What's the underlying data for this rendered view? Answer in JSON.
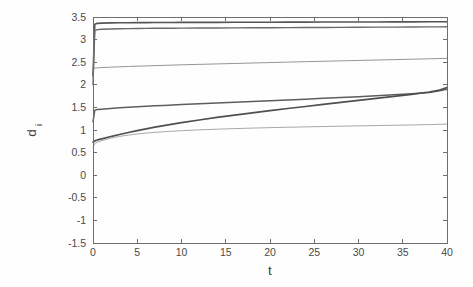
{
  "figure": {
    "background_color": "#fefefe",
    "axes_color": "#6e6e6e",
    "tick_label_color": "#4a4a4a"
  },
  "chart_data": {
    "type": "line",
    "title": "",
    "subtitle": "",
    "xlabel": "t",
    "ylabel": "d_i",
    "ylabel_base": "d",
    "ylabel_subscript": "i",
    "xlim": [
      0,
      40
    ],
    "ylim": [
      -1.5,
      3.5
    ],
    "xticks": [
      0,
      5,
      10,
      15,
      20,
      25,
      30,
      35,
      40
    ],
    "xtick_labels": [
      "0",
      "5",
      "10",
      "15",
      "20",
      "25",
      "30",
      "35",
      "40"
    ],
    "yticks": [
      -1.5,
      -1,
      -0.5,
      0,
      0.5,
      1,
      1.5,
      2,
      2.5,
      3,
      3.5
    ],
    "ytick_labels": [
      "-1.5",
      "-1",
      "-0.5",
      "0",
      "0.5",
      "1",
      "1.5",
      "2",
      "2.5",
      "3",
      "3.5"
    ],
    "grid": false,
    "legend": null,
    "legend_position": "none",
    "annotations": [],
    "x": [
      0,
      0.2,
      0.5,
      1,
      2,
      3,
      4,
      5,
      6,
      7,
      8,
      9,
      10,
      12,
      14,
      16,
      18,
      20,
      22,
      24,
      26,
      28,
      30,
      32,
      34,
      36,
      38,
      39,
      40
    ],
    "series": [
      {
        "name": "d_1",
        "color": "#555555",
        "width": 1.6,
        "values": [
          2.2,
          3.34,
          3.36,
          3.365,
          3.37,
          3.372,
          3.374,
          3.375,
          3.376,
          3.377,
          3.378,
          3.379,
          3.38,
          3.381,
          3.382,
          3.383,
          3.384,
          3.385,
          3.386,
          3.387,
          3.388,
          3.389,
          3.39,
          3.391,
          3.392,
          3.393,
          3.394,
          3.395,
          3.396
        ]
      },
      {
        "name": "d_2",
        "color": "#6a6a6a",
        "width": 1.4,
        "values": [
          2.0,
          3.2,
          3.22,
          3.23,
          3.235,
          3.24,
          3.243,
          3.246,
          3.248,
          3.25,
          3.251,
          3.252,
          3.253,
          3.255,
          3.257,
          3.259,
          3.261,
          3.263,
          3.265,
          3.267,
          3.269,
          3.271,
          3.273,
          3.275,
          3.277,
          3.279,
          3.281,
          3.282,
          3.283
        ]
      },
      {
        "name": "d_3",
        "color": "#969696",
        "width": 1.0,
        "values": [
          2.33,
          2.37,
          2.375,
          2.38,
          2.39,
          2.398,
          2.405,
          2.412,
          2.418,
          2.424,
          2.43,
          2.436,
          2.442,
          2.452,
          2.462,
          2.472,
          2.482,
          2.492,
          2.502,
          2.512,
          2.521,
          2.53,
          2.539,
          2.548,
          2.557,
          2.566,
          2.575,
          2.58,
          2.585
        ]
      },
      {
        "name": "d_4",
        "color": "#5d5d5d",
        "width": 1.5,
        "values": [
          1.18,
          1.44,
          1.452,
          1.46,
          1.475,
          1.49,
          1.502,
          1.513,
          1.524,
          1.534,
          1.544,
          1.553,
          1.562,
          1.58,
          1.597,
          1.613,
          1.63,
          1.647,
          1.664,
          1.682,
          1.7,
          1.718,
          1.737,
          1.757,
          1.778,
          1.8,
          1.83,
          1.86,
          1.9
        ]
      },
      {
        "name": "d_5",
        "color": "#4f4f4f",
        "width": 1.7,
        "values": [
          0.73,
          0.76,
          0.78,
          0.805,
          0.855,
          0.9,
          0.945,
          0.985,
          1.025,
          1.062,
          1.098,
          1.13,
          1.162,
          1.222,
          1.278,
          1.33,
          1.38,
          1.428,
          1.475,
          1.52,
          1.565,
          1.61,
          1.655,
          1.7,
          1.745,
          1.79,
          1.84,
          1.875,
          1.94
        ]
      },
      {
        "name": "d_6",
        "color": "#a8a8a8",
        "width": 1.0,
        "values": [
          0.62,
          0.7,
          0.73,
          0.765,
          0.82,
          0.858,
          0.888,
          0.912,
          0.932,
          0.948,
          0.962,
          0.974,
          0.985,
          1.003,
          1.018,
          1.031,
          1.042,
          1.052,
          1.061,
          1.069,
          1.077,
          1.084,
          1.091,
          1.098,
          1.105,
          1.112,
          1.12,
          1.125,
          1.13
        ]
      }
    ]
  }
}
